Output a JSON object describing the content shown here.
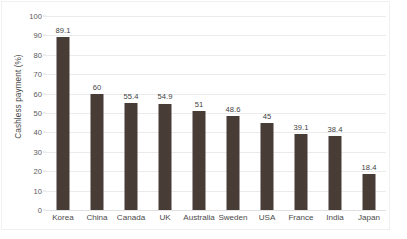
{
  "chart_data": {
    "type": "bar",
    "title": "",
    "subtitle": "",
    "xlabel": "",
    "ylabel": "Cashless payment (%)",
    "categories": [
      "Korea",
      "China",
      "Canada",
      "UK",
      "Australia",
      "Sweden",
      "USA",
      "France",
      "India",
      "Japan"
    ],
    "values": [
      89.1,
      60,
      55.4,
      54.9,
      51,
      48.6,
      45,
      39.1,
      38.4,
      18.4
    ],
    "value_labels": [
      "89.1",
      "60",
      "55.4",
      "54.9",
      "51",
      "48.6",
      "45",
      "39.1",
      "38.4",
      "18.4"
    ],
    "ylim": [
      0,
      100
    ],
    "ytick_labels": [
      "100",
      "90",
      "80",
      "70",
      "60",
      "50",
      "40",
      "30",
      "20",
      "10",
      "0"
    ],
    "ytick_values": [
      100,
      90,
      80,
      70,
      60,
      50,
      40,
      30,
      20,
      10,
      0
    ],
    "grid": true,
    "grid_axis": "y",
    "legend": false,
    "legend_position": "none",
    "series": [
      {
        "name": "Cashless payment",
        "values": [
          89.1,
          60,
          55.4,
          54.9,
          51,
          48.6,
          45,
          39.1,
          38.4,
          18.4
        ]
      }
    ],
    "colors": {
      "bar": "#473d36",
      "gridline": "#ebebeb",
      "axis_text": "#4a4a4a",
      "value_text": "#3f3f3f",
      "frame": "#f0f0f0",
      "background": "#ffffff"
    }
  }
}
